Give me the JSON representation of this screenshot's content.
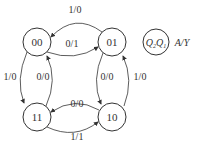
{
  "diagram": {
    "type": "state-diagram",
    "states": [
      {
        "id": "00",
        "label": "00",
        "cx": 37,
        "cy": 42
      },
      {
        "id": "01",
        "label": "01",
        "cx": 112,
        "cy": 42
      },
      {
        "id": "11",
        "label": "11",
        "cx": 37,
        "cy": 117
      },
      {
        "id": "10",
        "label": "10",
        "cx": 112,
        "cy": 117
      }
    ],
    "transitions": [
      {
        "from": "01",
        "to": "00",
        "label": "1/0"
      },
      {
        "from": "00",
        "to": "01",
        "label": "0/1"
      },
      {
        "from": "00",
        "to": "11",
        "label": "1/0"
      },
      {
        "from": "11",
        "to": "00",
        "label": "0/0"
      },
      {
        "from": "01",
        "to": "10",
        "label": "0/0"
      },
      {
        "from": "10",
        "to": "01",
        "label": "1/0"
      },
      {
        "from": "10",
        "to": "11",
        "label": "0/0"
      },
      {
        "from": "11",
        "to": "10",
        "label": "1/1"
      }
    ],
    "legend": {
      "state_label": "Q2Q1",
      "state_main_1": "Q",
      "state_sub_1": "2",
      "state_main_2": "Q",
      "state_sub_2": "1",
      "io_label": "A/Y"
    }
  }
}
